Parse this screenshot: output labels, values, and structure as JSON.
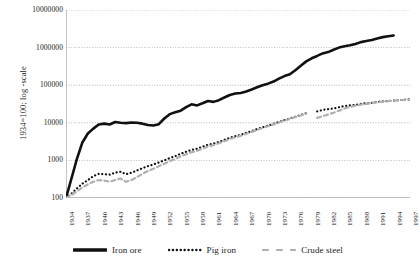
{
  "chart_data": {
    "type": "line",
    "title": "",
    "xlabel": "",
    "ylabel": "1934=100; log -scale",
    "log_y": true,
    "ylim": [
      100,
      10000000
    ],
    "ytick_labels": [
      "10000000",
      "1000000",
      "100000",
      "10000",
      "1000",
      "100"
    ],
    "ytick_values": [
      10000000,
      1000000,
      100000,
      10000,
      1000,
      100
    ],
    "xlim": [
      1934,
      1997
    ],
    "xtick_labels": [
      "1934",
      "1937",
      "1940",
      "1943",
      "1946",
      "1949",
      "1952",
      "1955",
      "1958",
      "1961",
      "1964",
      "1967",
      "1970",
      "1973",
      "1976",
      "1979",
      "1982",
      "1985",
      "1988",
      "1991",
      "1994",
      "1997"
    ],
    "grid": "horizontal-dotted",
    "legend_position": "bottom",
    "x": [
      1934,
      1935,
      1936,
      1937,
      1938,
      1939,
      1940,
      1941,
      1942,
      1943,
      1944,
      1945,
      1946,
      1947,
      1948,
      1949,
      1950,
      1951,
      1952,
      1953,
      1954,
      1955,
      1956,
      1957,
      1958,
      1959,
      1960,
      1961,
      1962,
      1963,
      1964,
      1965,
      1966,
      1967,
      1968,
      1969,
      1970,
      1971,
      1972,
      1973,
      1974,
      1975,
      1976,
      1977,
      1978,
      1979,
      1980,
      1981,
      1982,
      1983,
      1984,
      1985,
      1986,
      1987,
      1988,
      1989,
      1990,
      1991,
      1992,
      1993,
      1994,
      1995,
      1996,
      1997
    ],
    "series": [
      {
        "name": "Iron ore",
        "style": "solid",
        "color": "#111111",
        "width": 2.6,
        "values": [
          100,
          330,
          1100,
          3000,
          5200,
          7000,
          9000,
          9500,
          9000,
          10500,
          10000,
          9800,
          10200,
          10000,
          9500,
          8700,
          8500,
          9200,
          13000,
          17000,
          19000,
          21000,
          26000,
          31000,
          29000,
          33000,
          38000,
          36000,
          40000,
          47000,
          55000,
          60000,
          62000,
          68000,
          77000,
          88000,
          100000,
          110000,
          125000,
          150000,
          175000,
          195000,
          250000,
          330000,
          430000,
          520000,
          600000,
          700000,
          760000,
          880000,
          1000000,
          1080000,
          1150000,
          1250000,
          1400000,
          1500000,
          1600000,
          1750000,
          1900000,
          2000000,
          2100000,
          null,
          null,
          null
        ]
      },
      {
        "name": "Pig iron",
        "style": "dotted",
        "color": "#111111",
        "width": 2.2,
        "values": [
          100,
          130,
          180,
          240,
          300,
          380,
          440,
          430,
          420,
          470,
          500,
          430,
          470,
          540,
          620,
          700,
          780,
          880,
          1000,
          1150,
          1300,
          1500,
          1700,
          1900,
          2050,
          2300,
          2600,
          2800,
          3100,
          3500,
          4000,
          4400,
          4800,
          5400,
          6000,
          6800,
          7600,
          8400,
          9400,
          10500,
          11800,
          13000,
          14500,
          16000,
          18000,
          null,
          20000,
          22000,
          23000,
          24000,
          26000,
          28000,
          29000,
          30000,
          32000,
          33000,
          34000,
          36000,
          37000,
          38000,
          39000,
          40000,
          41000,
          42000
        ]
      },
      {
        "name": "Crude steel",
        "style": "dashed",
        "color": "#b0b0b0",
        "width": 2.2,
        "values": [
          100,
          120,
          150,
          190,
          230,
          270,
          300,
          290,
          270,
          300,
          330,
          270,
          300,
          360,
          440,
          520,
          600,
          700,
          820,
          960,
          1100,
          1280,
          1450,
          1650,
          1800,
          2050,
          2350,
          2550,
          2850,
          3250,
          3700,
          4100,
          4500,
          5100,
          5700,
          6500,
          7300,
          8100,
          9100,
          10200,
          11500,
          12700,
          14200,
          15700,
          17600,
          null,
          13500,
          15000,
          16500,
          18500,
          21000,
          24000,
          26500,
          28500,
          30500,
          32000,
          33500,
          35000,
          36500,
          37500,
          38500,
          39500,
          40500,
          41500
        ]
      }
    ]
  },
  "legend": {
    "items": [
      {
        "label": "Iron ore",
        "style": "solid",
        "color": "#111111"
      },
      {
        "label": "Pig iron",
        "style": "dotted",
        "color": "#111111"
      },
      {
        "label": "Crude steel",
        "style": "dashed",
        "color": "#b0b0b0"
      }
    ]
  }
}
